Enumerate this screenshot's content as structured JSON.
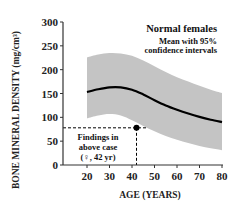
{
  "chart_data": {
    "type": "line",
    "title": "",
    "xlabel": "AGE (YEARS)",
    "ylabel": "BONE MINERAL DENSITY",
    "ylabel_unit": "(mg/cm³)",
    "xlim": [
      20,
      80
    ],
    "ylim": [
      0,
      300
    ],
    "x_ticks": [
      20,
      30,
      40,
      50,
      60,
      70,
      80
    ],
    "y_ticks": [
      0,
      50,
      100,
      150,
      200,
      250,
      300
    ],
    "grid": false,
    "legend": {
      "placement": "top-right",
      "title": "Normal females",
      "subtitle_lines": [
        "Mean with 95%",
        "confidence intervals"
      ]
    },
    "series": [
      {
        "name": "Mean",
        "x": [
          20,
          25,
          30,
          35,
          40,
          45,
          50,
          55,
          60,
          65,
          70,
          75,
          80
        ],
        "values": [
          153,
          159,
          163,
          163,
          158,
          148,
          136,
          125,
          116,
          108,
          101,
          95,
          90
        ]
      },
      {
        "name": "95% CI upper",
        "x": [
          20,
          25,
          30,
          35,
          40,
          45,
          50,
          55,
          60,
          65,
          70,
          75,
          80
        ],
        "values": [
          226,
          232,
          235,
          234,
          229,
          219,
          207,
          195,
          184,
          175,
          166,
          158,
          151
        ]
      },
      {
        "name": "95% CI lower",
        "x": [
          20,
          25,
          30,
          35,
          40,
          45,
          50,
          55,
          60,
          65,
          70,
          75,
          80
        ],
        "values": [
          98,
          104,
          107,
          104,
          94,
          82,
          71,
          61,
          53,
          46,
          40,
          35,
          31
        ]
      }
    ],
    "highlight_point": {
      "x": 42,
      "y": 78
    },
    "annotation_lines": [
      "Findings in",
      "above case",
      "(♀, 42 yr)"
    ]
  }
}
